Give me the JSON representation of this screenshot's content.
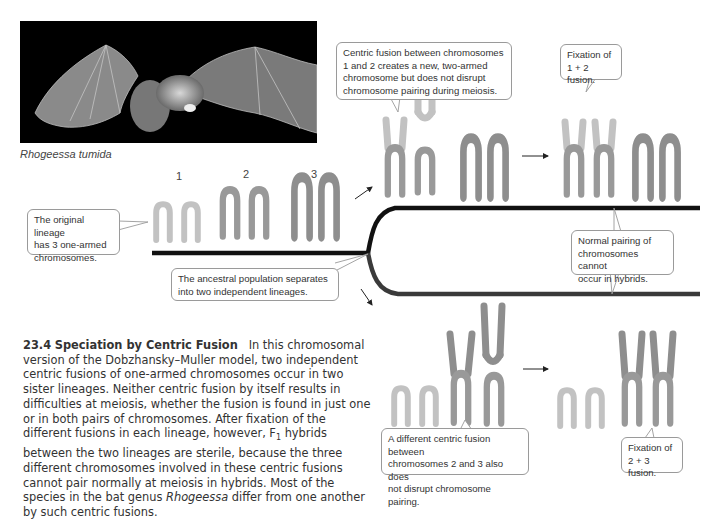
{
  "photo": {
    "alt": "Photograph of a bat in flight on black background",
    "species_caption": "Rhogeessa tumida"
  },
  "chromosome_labels": [
    "1",
    "2",
    "3"
  ],
  "callouts": {
    "original_lineage": "The original lineage has 3 one-armed chromosomes.",
    "ancestral_split": "The ancestral population separates into two independent lineages.",
    "fusion_1_2": "Centric fusion between chromosomes 1 and 2 creates a new, two-armed chromosome but does not disrupt chromosome pairing during meiosis.",
    "fixation_1_2": "Fixation of 1 + 2 fusion.",
    "hybrid_pairing": "Normal pairing of chromosomes cannot occur in hybrids.",
    "fusion_2_3": "A different centric fusion between chromosomes 2 and 3 also does not disrupt chromosome pairing.",
    "fixation_2_3": "Fixation of 2 + 3 fusion."
  },
  "callout_lines": {
    "original_lineage": [
      "The original lineage",
      "has 3 one-armed",
      "chromosomes."
    ],
    "ancestral_split": [
      "The ancestral population separates",
      "into two independent lineages."
    ],
    "fusion_1_2": [
      "Centric fusion between chromosomes",
      "1 and 2 creates a new, two-armed",
      "chromosome but does not disrupt",
      "chromosome pairing during meiosis."
    ],
    "fixation_1_2": [
      "Fixation of",
      "1 + 2 fusion."
    ],
    "hybrid_pairing": [
      "Normal pairing of",
      "chromosomes cannot",
      "occur in hybrids."
    ],
    "fusion_2_3": [
      "A different centric fusion between",
      "chromosomes 2 and 3 also does",
      "not disrupt chromosome pairing."
    ],
    "fixation_2_3": [
      "Fixation of",
      "2 + 3 fusion."
    ]
  },
  "figure_caption": {
    "number": "23.4",
    "title": "Speciation by Centric Fusion",
    "body_before_italic": "In this chromosomal version of the Dobzhansky–Muller model, two independent centric fusions of one-armed chromosomes occur in two sister lineages. Neither centric fusion by itself results in difficulties at meiosis, whether the fusion is found in just one or in both pairs of chromosomes. After fixation of the different fusions in each lineage, however, F",
    "subscript": "1",
    "body_after_subscript": " hybrids between the two lineages are sterile, because the three different chromosomes involved in these centric fusions cannot pair normally at meiosis in hybrids. Most of the species in the bat genus ",
    "italic_genus": "Rhogeessa",
    "body_end": " differ from one another by such centric fusions."
  },
  "colors": {
    "chromosome_1": "#c9c9c9",
    "chromosome_2": "#9a9a9a",
    "chromosome_3": "#8e8e8e",
    "lineage_line_top": "#111111",
    "lineage_line_bottom": "#3a3a3a",
    "callout_border": "#9a9a9a"
  }
}
